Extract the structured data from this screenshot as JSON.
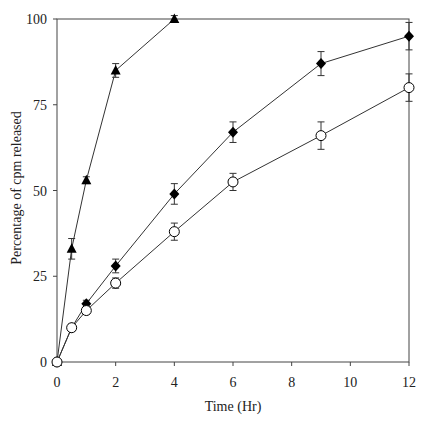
{
  "chart_data": {
    "type": "line",
    "title": "",
    "xlabel": "Time (Hr)",
    "ylabel": "Percentage of cpm released",
    "xlim": [
      0,
      12
    ],
    "ylim": [
      0,
      100
    ],
    "xticks": [
      0,
      2,
      4,
      6,
      8,
      10,
      12
    ],
    "yticks": [
      0,
      25,
      50,
      75,
      100
    ],
    "grid": false,
    "legend": null,
    "series": [
      {
        "name": "triangle-series",
        "marker": "filled-triangle",
        "x": [
          0,
          0.5,
          1,
          2,
          4
        ],
        "y": [
          0,
          33,
          53,
          85,
          100
        ],
        "err": [
          0,
          3,
          1,
          2,
          1
        ]
      },
      {
        "name": "diamond-series",
        "marker": "filled-diamond",
        "x": [
          0,
          0.5,
          1,
          2,
          4,
          6,
          9,
          12
        ],
        "y": [
          0,
          10,
          17,
          28,
          49,
          67,
          87,
          95
        ],
        "err": [
          0,
          1,
          1,
          2,
          3,
          3,
          3.5,
          4
        ]
      },
      {
        "name": "circle-series",
        "marker": "open-circle",
        "x": [
          0,
          0.5,
          1,
          2,
          4,
          6,
          9,
          12
        ],
        "y": [
          0,
          10,
          15,
          23,
          38,
          52.5,
          66,
          80
        ],
        "err": [
          0,
          1,
          1,
          1.5,
          2.5,
          2.5,
          4,
          4
        ]
      }
    ]
  },
  "colors": {
    "axis": "#444444",
    "line": "#333333",
    "marker": "#000000",
    "background": "#ffffff"
  }
}
